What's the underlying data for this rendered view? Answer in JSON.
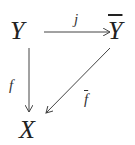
{
  "diagram": {
    "type": "commutative-diagram",
    "nodes": {
      "Y": {
        "label": "Y"
      },
      "Ybar": {
        "label": "Y"
      },
      "X": {
        "label": "X"
      }
    },
    "edges": {
      "j": {
        "from": "Y",
        "to": "Ybar",
        "label": "j"
      },
      "f": {
        "from": "Y",
        "to": "X",
        "label": "f"
      },
      "fbar": {
        "from": "Ybar",
        "to": "X",
        "label": "f"
      }
    },
    "colors": {
      "ink": "#333333",
      "background": "#ffffff"
    }
  }
}
